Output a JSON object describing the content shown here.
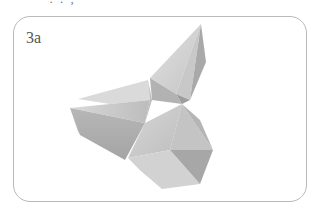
{
  "header": {
    "partial_text": "' .  .  ,"
  },
  "panel": {
    "label": "3a",
    "border_color": "#b9b9b9"
  },
  "figure": {
    "fill_colors": {
      "lightest": "#dcdcdc",
      "light": "#cfcfcf",
      "mid": "#bdbdbd",
      "dark": "#a8a8a8",
      "darkest": "#969696"
    }
  }
}
